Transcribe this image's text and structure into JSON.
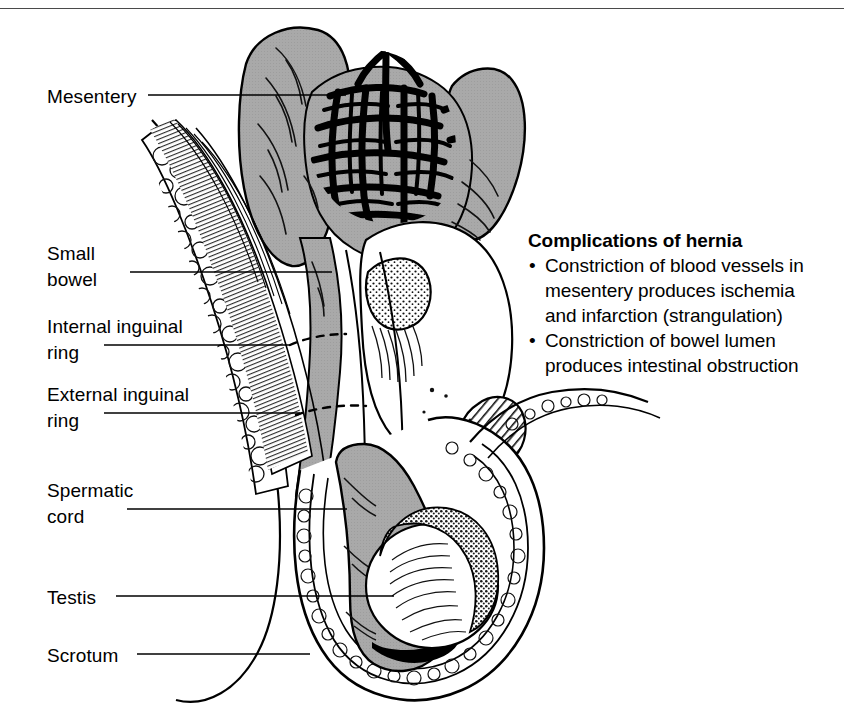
{
  "figure": {
    "type": "medical-illustration",
    "top_rule_color": "#4a4a4a",
    "bowel_fill_color": "#a8a8a8",
    "ink_color": "#000000",
    "background_color": "#ffffff"
  },
  "callouts": [
    {
      "id": "mesentery",
      "label": "Mesentery",
      "label_x": 47,
      "label_y": 84,
      "line_x1": 148,
      "line_x2": 346,
      "line_y": 95
    },
    {
      "id": "small-bowel",
      "label": "Small\nbowel",
      "label_x": 47,
      "label_y": 241,
      "line_x1": 130,
      "line_x2": 332,
      "line_y": 272
    },
    {
      "id": "internal-ring",
      "label": "Internal inguinal\nring",
      "label_x": 47,
      "label_y": 314,
      "line_x1": 104,
      "line_x2": 290,
      "line_y": 345
    },
    {
      "id": "external-ring",
      "label": "External inguinal\nring",
      "label_x": 47,
      "label_y": 382,
      "line_x1": 104,
      "line_x2": 300,
      "line_y": 413
    },
    {
      "id": "spermatic-cord",
      "label": "Spermatic\ncord",
      "label_x": 47,
      "label_y": 478,
      "line_x1": 127,
      "line_x2": 347,
      "line_y": 509
    },
    {
      "id": "testis",
      "label": "Testis",
      "label_x": 47,
      "label_y": 585,
      "line_x1": 116,
      "line_x2": 394,
      "line_y": 596
    },
    {
      "id": "scrotum",
      "label": "Scrotum",
      "label_x": 47,
      "label_y": 643,
      "line_x1": 137,
      "line_x2": 310,
      "line_y": 654
    }
  ],
  "note": {
    "title": "Complications of hernia",
    "bullet_glyph": "•",
    "items": [
      "Constriction of blood vessels in mesentery produces ischemia and infarction (strangulation)",
      "Constriction of bowel lumen produces intestinal obstruction"
    ]
  }
}
